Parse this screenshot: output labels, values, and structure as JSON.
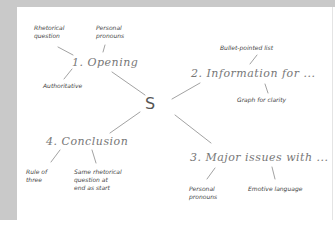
{
  "mindmap": {
    "center": "S",
    "branches": [
      {
        "label": "1. Opening",
        "children": [
          "Rhetorical question",
          "Personal pronouns",
          "Authoritative"
        ]
      },
      {
        "label": "2. Information for ...",
        "children": [
          "Bullet-pointed list",
          "Graph for clarity"
        ]
      },
      {
        "label": "3. Major issues with ...",
        "children": [
          "Personal pronouns",
          "Emotive language"
        ]
      },
      {
        "label": "4. Conclusion",
        "children": [
          "Rule of three",
          "Same rhetorical question at end as start"
        ]
      }
    ]
  },
  "nodes": {
    "b1": "1. Opening",
    "b1c1a": "Rhetorical",
    "b1c1b": "question",
    "b1c2a": "Personal",
    "b1c2b": "pronouns",
    "b1c3": "Authoritative",
    "b2": "2. Information for ...",
    "b2c1": "Bullet-pointed list",
    "b2c2": "Graph for clarity",
    "b3": "3. Major issues with ...",
    "b3c1a": "Personal",
    "b3c1b": "pronouns",
    "b3c2": "Emotive language",
    "b4": "4. Conclusion",
    "b4c1a": "Rule of",
    "b4c1b": "three",
    "b4c2a": "Same rhetorical",
    "b4c2b": "question at",
    "b4c2c": "end as start"
  },
  "colors": {
    "frame": "#c9c9c9",
    "line": "#8a8a8a",
    "text": "#555555"
  }
}
